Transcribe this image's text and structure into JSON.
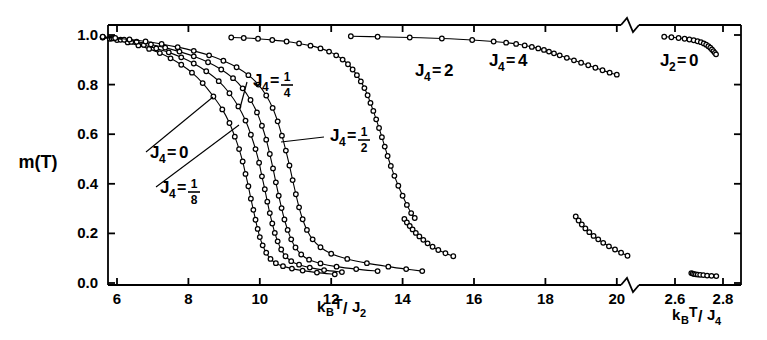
{
  "figure": {
    "ylabel": "m(T)",
    "xlabel_left": "k_B T/J_2",
    "xlabel_right": "k_B T/J_4",
    "axis_break": true
  },
  "chart_data": {
    "type": "line",
    "title": "",
    "xlabel": "k_B T/J_2   (right segment: k_B T/J_4)",
    "ylabel": "m(T)",
    "ylim": [
      0.0,
      1.0
    ],
    "yticks": [
      0.0,
      0.2,
      0.4,
      0.6,
      0.8,
      1.0
    ],
    "yticklabels": [
      "0.0",
      "0.2",
      "0.4",
      "0.6",
      "0.8",
      "1.0"
    ],
    "xlim_left": [
      5.4,
      21.1
    ],
    "xticks_left": [
      6,
      8,
      10,
      12,
      14,
      16,
      18,
      20
    ],
    "xticklabels_left": [
      "6",
      "8",
      "10",
      "12",
      "14",
      "16",
      "18",
      "20"
    ],
    "xlim_right": [
      2.52,
      2.85
    ],
    "xticks_right": [
      2.6,
      2.8
    ],
    "xticklabels_right": [
      "2.6",
      "2.8"
    ],
    "grid": false,
    "legend": "inline-annotations",
    "marker": "open-circle",
    "annotations": [
      {
        "label": "J_4 = 0",
        "text_x": 150,
        "text_y": 158,
        "leader_to_x": 213,
        "leader_to_y": 97
      },
      {
        "label": "J_4 = 1/8",
        "text_x": 160,
        "text_y": 193,
        "leader_to_x": 239,
        "leader_to_y": 125
      },
      {
        "label": "J_4 = 1/4",
        "text_x": 253,
        "text_y": 86,
        "leader_to_x": 240,
        "leader_to_y": 108
      },
      {
        "label": "J_4 = 1/2",
        "text_x": 330,
        "text_y": 141,
        "leader_to_x": 281,
        "leader_to_y": 142
      },
      {
        "label": "J_4 = 2",
        "text_x": 415,
        "text_y": 76,
        "leader_to_x": null,
        "leader_to_y": null
      },
      {
        "label": "J_4 = 4",
        "text_x": 489,
        "text_y": 66,
        "leader_to_x": null,
        "leader_to_y": null
      },
      {
        "label": "J_2 = 0",
        "text_x": 660,
        "text_y": 66,
        "leader_to_x": null,
        "leader_to_y": null
      }
    ],
    "series": [
      {
        "name": "J_4 = 0",
        "x": [
          5.6,
          5.8,
          6.0,
          6.3,
          6.6,
          6.9,
          7.2,
          7.5,
          7.8,
          8.1,
          8.4,
          8.7,
          8.95,
          9.15,
          9.3,
          9.42,
          9.52,
          9.6,
          9.68,
          9.75,
          9.82,
          9.88,
          9.94,
          10.0,
          10.08,
          10.18,
          10.3,
          10.45,
          10.65,
          10.9,
          11.2,
          11.6,
          12.1
        ],
        "y": [
          0.99,
          0.985,
          0.98,
          0.97,
          0.958,
          0.944,
          0.927,
          0.906,
          0.88,
          0.848,
          0.806,
          0.752,
          0.7,
          0.645,
          0.59,
          0.54,
          0.49,
          0.44,
          0.39,
          0.34,
          0.295,
          0.255,
          0.218,
          0.185,
          0.152,
          0.122,
          0.097,
          0.08,
          0.068,
          0.058,
          0.05,
          0.042,
          0.035
        ]
      },
      {
        "name": "J_4 = 1/8",
        "x": [
          5.6,
          5.85,
          6.1,
          6.4,
          6.75,
          7.1,
          7.45,
          7.8,
          8.15,
          8.5,
          8.85,
          9.15,
          9.4,
          9.6,
          9.75,
          9.88,
          9.98,
          10.06,
          10.14,
          10.21,
          10.28,
          10.35,
          10.42,
          10.5,
          10.6,
          10.72,
          10.88,
          11.1,
          11.4,
          11.8,
          12.3
        ],
        "y": [
          0.991,
          0.986,
          0.981,
          0.972,
          0.96,
          0.946,
          0.93,
          0.91,
          0.885,
          0.854,
          0.814,
          0.765,
          0.712,
          0.655,
          0.598,
          0.54,
          0.485,
          0.43,
          0.378,
          0.328,
          0.282,
          0.24,
          0.202,
          0.168,
          0.135,
          0.108,
          0.088,
          0.074,
          0.062,
          0.052,
          0.044
        ]
      },
      {
        "name": "J_4 = 1/4",
        "x": [
          5.6,
          5.9,
          6.2,
          6.55,
          6.95,
          7.35,
          7.75,
          8.15,
          8.55,
          8.92,
          9.25,
          9.52,
          9.74,
          9.92,
          10.06,
          10.18,
          10.28,
          10.37,
          10.45,
          10.53,
          10.61,
          10.69,
          10.78,
          10.88,
          11.0,
          11.16,
          11.38,
          11.7,
          12.15,
          12.7,
          13.3
        ],
        "y": [
          0.992,
          0.987,
          0.981,
          0.973,
          0.962,
          0.949,
          0.933,
          0.914,
          0.89,
          0.861,
          0.826,
          0.785,
          0.738,
          0.688,
          0.634,
          0.578,
          0.52,
          0.462,
          0.406,
          0.352,
          0.302,
          0.256,
          0.214,
          0.176,
          0.143,
          0.115,
          0.094,
          0.079,
          0.066,
          0.056,
          0.048
        ]
      },
      {
        "name": "J_4 = 1/2",
        "x": [
          5.6,
          5.95,
          6.35,
          6.8,
          7.25,
          7.7,
          8.15,
          8.58,
          8.98,
          9.35,
          9.68,
          9.96,
          10.18,
          10.36,
          10.5,
          10.62,
          10.73,
          10.83,
          10.92,
          11.01,
          11.1,
          11.2,
          11.32,
          11.48,
          11.7,
          12.0,
          12.45,
          13.0,
          13.6,
          14.1,
          14.55
        ],
        "y": [
          0.993,
          0.988,
          0.982,
          0.974,
          0.964,
          0.951,
          0.936,
          0.918,
          0.896,
          0.87,
          0.838,
          0.8,
          0.756,
          0.706,
          0.652,
          0.594,
          0.534,
          0.474,
          0.415,
          0.358,
          0.305,
          0.257,
          0.214,
          0.176,
          0.144,
          0.118,
          0.097,
          0.08,
          0.066,
          0.056,
          0.048
        ]
      },
      {
        "name": "J_4 = 2 (upper branch)",
        "x": [
          9.2,
          9.55,
          9.95,
          10.35,
          10.75,
          11.1,
          11.42,
          11.7,
          11.94,
          12.14,
          12.32,
          12.47,
          12.6,
          12.72,
          12.83,
          12.93,
          13.02,
          13.1,
          13.18,
          13.26,
          13.34,
          13.42,
          13.5,
          13.58,
          13.67,
          13.77,
          13.88,
          14.0,
          14.12,
          14.24,
          14.34
        ],
        "y": [
          0.99,
          0.988,
          0.985,
          0.98,
          0.974,
          0.966,
          0.957,
          0.946,
          0.933,
          0.918,
          0.901,
          0.882,
          0.861,
          0.838,
          0.813,
          0.786,
          0.757,
          0.726,
          0.694,
          0.66,
          0.625,
          0.588,
          0.55,
          0.512,
          0.472,
          0.432,
          0.392,
          0.352,
          0.315,
          0.282,
          0.262
        ]
      },
      {
        "name": "J_4 = 2 (lower tail)",
        "x": [
          14.05,
          14.12,
          14.2,
          14.28,
          14.37,
          14.47,
          14.58,
          14.7,
          14.84,
          15.0,
          15.2,
          15.42
        ],
        "y": [
          0.258,
          0.244,
          0.23,
          0.216,
          0.202,
          0.188,
          0.174,
          0.16,
          0.146,
          0.133,
          0.12,
          0.108
        ]
      },
      {
        "name": "J_4 = 4 (upper branch)",
        "x": [
          12.55,
          13.3,
          14.2,
          15.1,
          15.95,
          16.55,
          16.9,
          17.18,
          17.42,
          17.62,
          17.8,
          17.96,
          18.1,
          18.24,
          18.4,
          18.6,
          18.8,
          19.0,
          19.2,
          19.4,
          19.6,
          19.8,
          20.0
        ],
        "y": [
          0.995,
          0.993,
          0.99,
          0.986,
          0.98,
          0.974,
          0.969,
          0.964,
          0.958,
          0.952,
          0.946,
          0.94,
          0.933,
          0.926,
          0.918,
          0.908,
          0.898,
          0.888,
          0.878,
          0.868,
          0.858,
          0.848,
          0.84
        ]
      },
      {
        "name": "J_4 = 4 (lower tail)",
        "x": [
          18.85,
          18.93,
          19.02,
          19.12,
          19.23,
          19.35,
          19.48,
          19.62,
          19.78,
          19.95,
          20.12,
          20.3
        ],
        "y": [
          0.268,
          0.252,
          0.236,
          0.22,
          0.205,
          0.19,
          0.176,
          0.162,
          0.148,
          0.135,
          0.122,
          0.11
        ]
      },
      {
        "name": "J_2 = 0",
        "x_right": [
          2.555,
          2.585,
          2.615,
          2.64,
          2.66,
          2.678,
          2.694,
          2.708,
          2.72,
          2.73,
          2.739,
          2.747,
          2.754,
          2.76,
          2.766,
          2.771
        ],
        "y": [
          0.993,
          0.991,
          0.988,
          0.985,
          0.982,
          0.979,
          0.975,
          0.971,
          0.966,
          0.961,
          0.955,
          0.949,
          0.942,
          0.935,
          0.928,
          0.922
        ]
      },
      {
        "name": "J_2 = 0 (lower tail)",
        "x_right": [
          2.668,
          2.674,
          2.68,
          2.687,
          2.695,
          2.705,
          2.718,
          2.734,
          2.752,
          2.772
        ],
        "y": [
          0.04,
          0.038,
          0.036,
          0.035,
          0.034,
          0.033,
          0.032,
          0.03,
          0.029,
          0.028
        ]
      }
    ]
  }
}
